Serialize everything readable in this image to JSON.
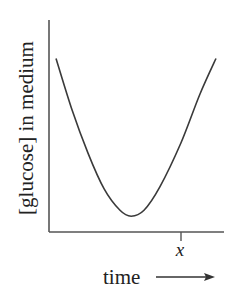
{
  "chart_data": {
    "type": "line",
    "title": "",
    "xlabel": "time",
    "ylabel": "[glucose] in medium",
    "x_tick_labels": [
      "x"
    ],
    "x_tick_positions": [
      0.78
    ],
    "axis_arrow": "right",
    "grid": false,
    "legend": null,
    "series": [
      {
        "name": "[glucose] in medium",
        "description": "U-shaped curve: high at start, decreases to a minimum near the middle of the time range, then rises back to the starting level by the end",
        "x": [
          0.0,
          0.1,
          0.2,
          0.3,
          0.4,
          0.47,
          0.55,
          0.65,
          0.78,
          0.9,
          1.0
        ],
        "y": [
          0.88,
          0.62,
          0.4,
          0.22,
          0.11,
          0.08,
          0.11,
          0.23,
          0.45,
          0.7,
          0.88
        ]
      }
    ],
    "xlim": [
      0,
      1
    ],
    "ylim": [
      0,
      1
    ]
  },
  "labels": {
    "ylabel": "[glucose] in medium",
    "xlabel": "time",
    "xtick": "x"
  },
  "colors": {
    "line": "#3a3a3a",
    "axis": "#555555",
    "text": "#222222"
  }
}
